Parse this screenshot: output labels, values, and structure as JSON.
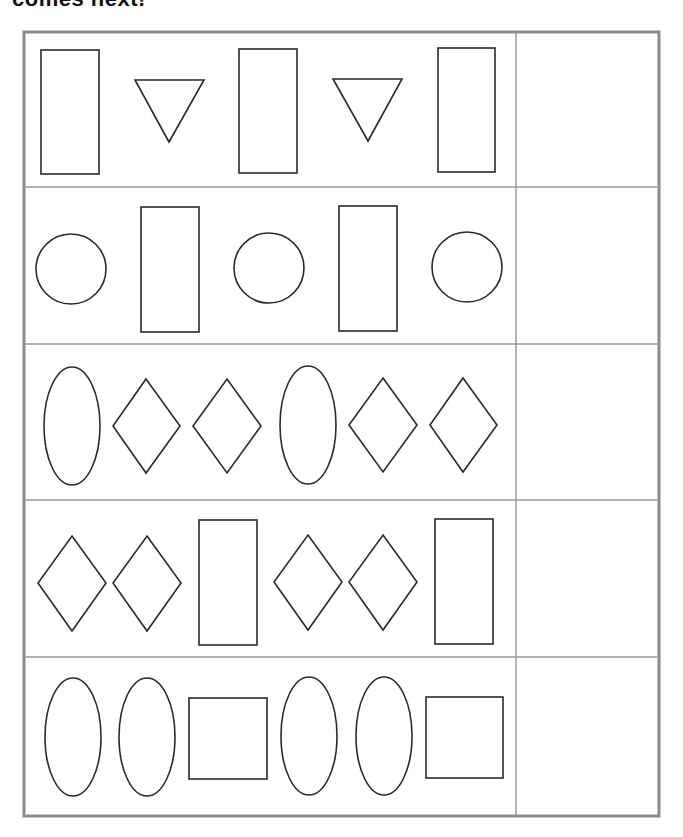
{
  "worksheet": {
    "title": "comes next!",
    "colors": {
      "frame": "#8a8a8a",
      "grid": "#9a9a9a",
      "shape_stroke": "#2a2a2a",
      "background": "#ffffff"
    },
    "rows": [
      {
        "index": 1,
        "pattern": [
          "rectangle",
          "triangle-down",
          "rectangle",
          "triangle-down",
          "rectangle"
        ],
        "answer": ""
      },
      {
        "index": 2,
        "pattern": [
          "circle",
          "rectangle",
          "circle",
          "rectangle",
          "circle"
        ],
        "answer": ""
      },
      {
        "index": 3,
        "pattern": [
          "ellipse",
          "diamond",
          "diamond",
          "ellipse",
          "diamond",
          "diamond"
        ],
        "answer": ""
      },
      {
        "index": 4,
        "pattern": [
          "diamond",
          "diamond",
          "rectangle",
          "diamond",
          "diamond",
          "rectangle"
        ],
        "answer": ""
      },
      {
        "index": 5,
        "pattern": [
          "ellipse",
          "ellipse",
          "square",
          "ellipse",
          "ellipse",
          "square"
        ],
        "answer": ""
      }
    ]
  }
}
